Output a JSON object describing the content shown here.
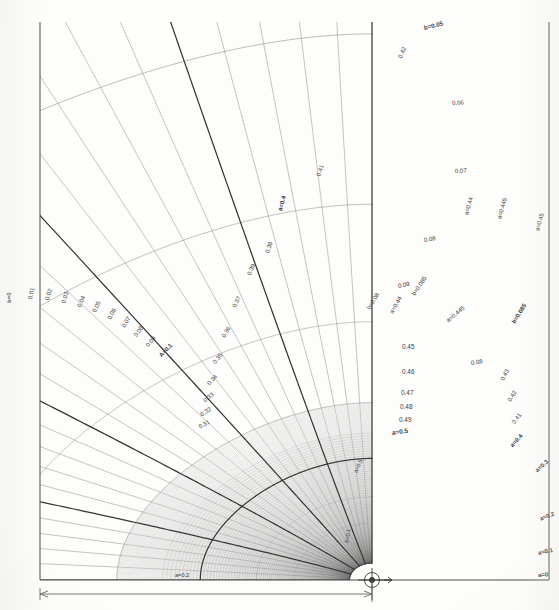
{
  "meta": {
    "page_header_ghost": "FIG. A-1   FLOW NET COORDINATES",
    "background_color": "#fdfdfc",
    "line_color": "#555350",
    "bold_line_color": "#2b2a28",
    "label_color": "#3a3a3a"
  },
  "frame": {
    "left": 40,
    "top": 22,
    "right": 549,
    "bottom": 580,
    "origin_x": 372,
    "origin_y": 580,
    "origin_marker": "center-circle-crosshair",
    "arrow_label": "r"
  },
  "dimension": {
    "y": 594,
    "x_start": 40,
    "x_end": 372,
    "label": ""
  },
  "chart_data": {
    "type": "line",
    "subtitle": "Families of constant-a (potential) and constant-b (stream) curves",
    "xlabel": "",
    "ylabel": "",
    "grid": true,
    "legend_position": "none",
    "coordinate_system": "bipolar / conformal",
    "origin": {
      "x": 372,
      "y": 580
    },
    "families": [
      {
        "name": "b = constant (arcs)",
        "symbol": "b",
        "values": [
          0,
          0.01,
          0.02,
          0.03,
          0.04,
          0.05,
          0.06,
          0.07,
          0.08,
          0.085,
          0.09,
          0.1
        ],
        "bold_at": [
          0,
          0.05,
          0.1
        ],
        "notes": "left-edge vertical line is b=0; arcs sweep right and upward"
      },
      {
        "name": "a = constant (radial/meridional)",
        "symbol": "a",
        "values": [
          0,
          0.1,
          0.2,
          0.3,
          0.31,
          0.32,
          0.33,
          0.34,
          0.35,
          0.36,
          0.37,
          0.38,
          0.39,
          0.4,
          0.41,
          0.42,
          0.43,
          0.44,
          0.445,
          0.45,
          0.46,
          0.47,
          0.48,
          0.49,
          0.5
        ],
        "bold_at": [
          0,
          0.1,
          0.2,
          0.3,
          0.4,
          0.5
        ],
        "notes": "curves converge toward origin at bottom-centre; a=0 at right frame edge"
      }
    ],
    "annotations": [
      "b=0",
      "A=0.1",
      "a=0.5",
      "a=0.4",
      "a=0.445",
      "a=0.45",
      "b=0.085",
      "b=0.05",
      "b=0.08"
    ]
  },
  "labels": {
    "left_band": [
      {
        "text": "b=0",
        "x": 9,
        "y": 300,
        "rot": -90,
        "size": 6.0,
        "bold": true
      },
      {
        "text": "0.01",
        "x": 30,
        "y": 296,
        "rot": -78,
        "size": 6.0
      },
      {
        "text": "0.02",
        "x": 47,
        "y": 297,
        "rot": -74,
        "size": 6.0
      },
      {
        "text": "0.03",
        "x": 63,
        "y": 300,
        "rot": -71,
        "size": 6.0
      },
      {
        "text": "0.04",
        "x": 79,
        "y": 304,
        "rot": -68,
        "size": 6.0
      },
      {
        "text": "0.05",
        "x": 94,
        "y": 309,
        "rot": -65,
        "size": 6.0
      },
      {
        "text": "0.06",
        "x": 109,
        "y": 316,
        "rot": -62,
        "size": 6.0
      },
      {
        "text": "0.07",
        "x": 123,
        "y": 324,
        "rot": -58,
        "size": 6.0
      },
      {
        "text": "0.08",
        "x": 135,
        "y": 333,
        "rot": -54,
        "size": 6.0
      },
      {
        "text": "0.09",
        "x": 147,
        "y": 343,
        "rot": -50,
        "size": 6.0
      },
      {
        "text": "A=0.1",
        "x": 160,
        "y": 353,
        "rot": -46,
        "size": 6.0,
        "bold": true
      }
    ],
    "upper_arcs": [
      {
        "text": "b=0.05",
        "x": 424,
        "y": 25,
        "rot": -14,
        "size": 6.2,
        "bold": true
      },
      {
        "text": "0.42",
        "x": 400,
        "y": 55,
        "rot": -68,
        "size": 6.0
      },
      {
        "text": "0.06",
        "x": 452,
        "y": 100,
        "rot": -4,
        "size": 6.0
      },
      {
        "text": "0.41",
        "x": 318,
        "y": 173,
        "rot": -70,
        "size": 6.0
      },
      {
        "text": "0.07",
        "x": 455,
        "y": 168,
        "rot": -3,
        "size": 6.0
      },
      {
        "text": "0.08",
        "x": 424,
        "y": 237,
        "rot": -8,
        "size": 6.0
      },
      {
        "text": "0.09",
        "x": 398,
        "y": 283,
        "rot": -12,
        "size": 6.0
      },
      {
        "text": "a=0.4",
        "x": 280,
        "y": 208,
        "rot": -75,
        "size": 6.2,
        "bold": true
      },
      {
        "text": "0.38",
        "x": 267,
        "y": 250,
        "rot": -72,
        "size": 6.0
      },
      {
        "text": "0.39",
        "x": 249,
        "y": 272,
        "rot": -68,
        "size": 6.0
      },
      {
        "text": "0.37",
        "x": 234,
        "y": 304,
        "rot": -64,
        "size": 6.0
      },
      {
        "text": "0.36",
        "x": 223,
        "y": 334,
        "rot": -58,
        "size": 6.0
      },
      {
        "text": "0.35",
        "x": 214,
        "y": 360,
        "rot": -52,
        "size": 6.0
      },
      {
        "text": "0.34",
        "x": 208,
        "y": 381,
        "rot": -46,
        "size": 6.0
      },
      {
        "text": "0.33",
        "x": 204,
        "y": 398,
        "rot": -40,
        "size": 6.0
      },
      {
        "text": "0.32",
        "x": 201,
        "y": 412,
        "rot": -34,
        "size": 6.0
      },
      {
        "text": "0.31",
        "x": 199,
        "y": 424,
        "rot": -28,
        "size": 6.0
      }
    ],
    "right_band": [
      {
        "text": "a=0.44",
        "x": 466,
        "y": 212,
        "rot": -74,
        "size": 6.0
      },
      {
        "text": "a=0.445",
        "x": 499,
        "y": 216,
        "rot": -74,
        "size": 6.0
      },
      {
        "text": "a=0.45",
        "x": 537,
        "y": 228,
        "rot": -74,
        "size": 6.0
      },
      {
        "text": "b=0.085",
        "x": 513,
        "y": 320,
        "rot": -58,
        "size": 6.0,
        "bold": true
      },
      {
        "text": "b=0.085",
        "x": 413,
        "y": 292,
        "rot": -56,
        "size": 6.0
      },
      {
        "text": "a=0.445",
        "x": 447,
        "y": 318,
        "rot": -40,
        "size": 6.0
      },
      {
        "text": "a=0.44",
        "x": 391,
        "y": 310,
        "rot": -60,
        "size": 6.0
      },
      {
        "text": "b=0.08",
        "x": 368,
        "y": 306,
        "rot": -58,
        "size": 6.0
      },
      {
        "text": "0.08",
        "x": 471,
        "y": 360,
        "rot": -8,
        "size": 6.0
      },
      {
        "text": "0.43",
        "x": 502,
        "y": 377,
        "rot": -62,
        "size": 6.0
      },
      {
        "text": "0.42",
        "x": 509,
        "y": 398,
        "rot": -58,
        "size": 6.0
      },
      {
        "text": "0.41",
        "x": 513,
        "y": 420,
        "rot": -52,
        "size": 6.0
      },
      {
        "text": "a=0.4",
        "x": 511,
        "y": 443,
        "rot": -46,
        "size": 6.0,
        "bold": true
      },
      {
        "text": "a=0.3",
        "x": 536,
        "y": 468,
        "rot": -42,
        "size": 6.0,
        "bold": true
      },
      {
        "text": "a=0.2",
        "x": 540,
        "y": 516,
        "rot": -22,
        "size": 6.0,
        "bold": true
      },
      {
        "text": "a=0.1",
        "x": 538,
        "y": 550,
        "rot": -12,
        "size": 6.0,
        "bold": true
      },
      {
        "text": "a=0",
        "x": 538,
        "y": 572,
        "rot": -4,
        "size": 6.0,
        "bold": true
      }
    ],
    "inner_fan": [
      {
        "text": "0.45",
        "x": 402,
        "y": 344,
        "rot": 0,
        "size": 6.4
      },
      {
        "text": "0.46",
        "x": 402,
        "y": 369,
        "rot": 0,
        "size": 6.4
      },
      {
        "text": "0.47",
        "x": 401,
        "y": 390,
        "rot": 0,
        "size": 6.4
      },
      {
        "text": "0.48",
        "x": 400,
        "y": 404,
        "rot": 0,
        "size": 6.4
      },
      {
        "text": "0.49",
        "x": 399,
        "y": 417,
        "rot": 0,
        "size": 6.4
      },
      {
        "text": "a=0.5",
        "x": 392,
        "y": 430,
        "rot": -8,
        "size": 6.4,
        "bold": true
      }
    ],
    "center_misc": [
      {
        "text": "a=0.5",
        "x": 356,
        "y": 470,
        "rot": -66,
        "size": 5.6
      },
      {
        "text": "b=0.1",
        "x": 347,
        "y": 540,
        "rot": -80,
        "size": 5.6
      },
      {
        "text": "a=0.2",
        "x": 175,
        "y": 573,
        "rot": 0,
        "size": 5.6
      }
    ]
  }
}
